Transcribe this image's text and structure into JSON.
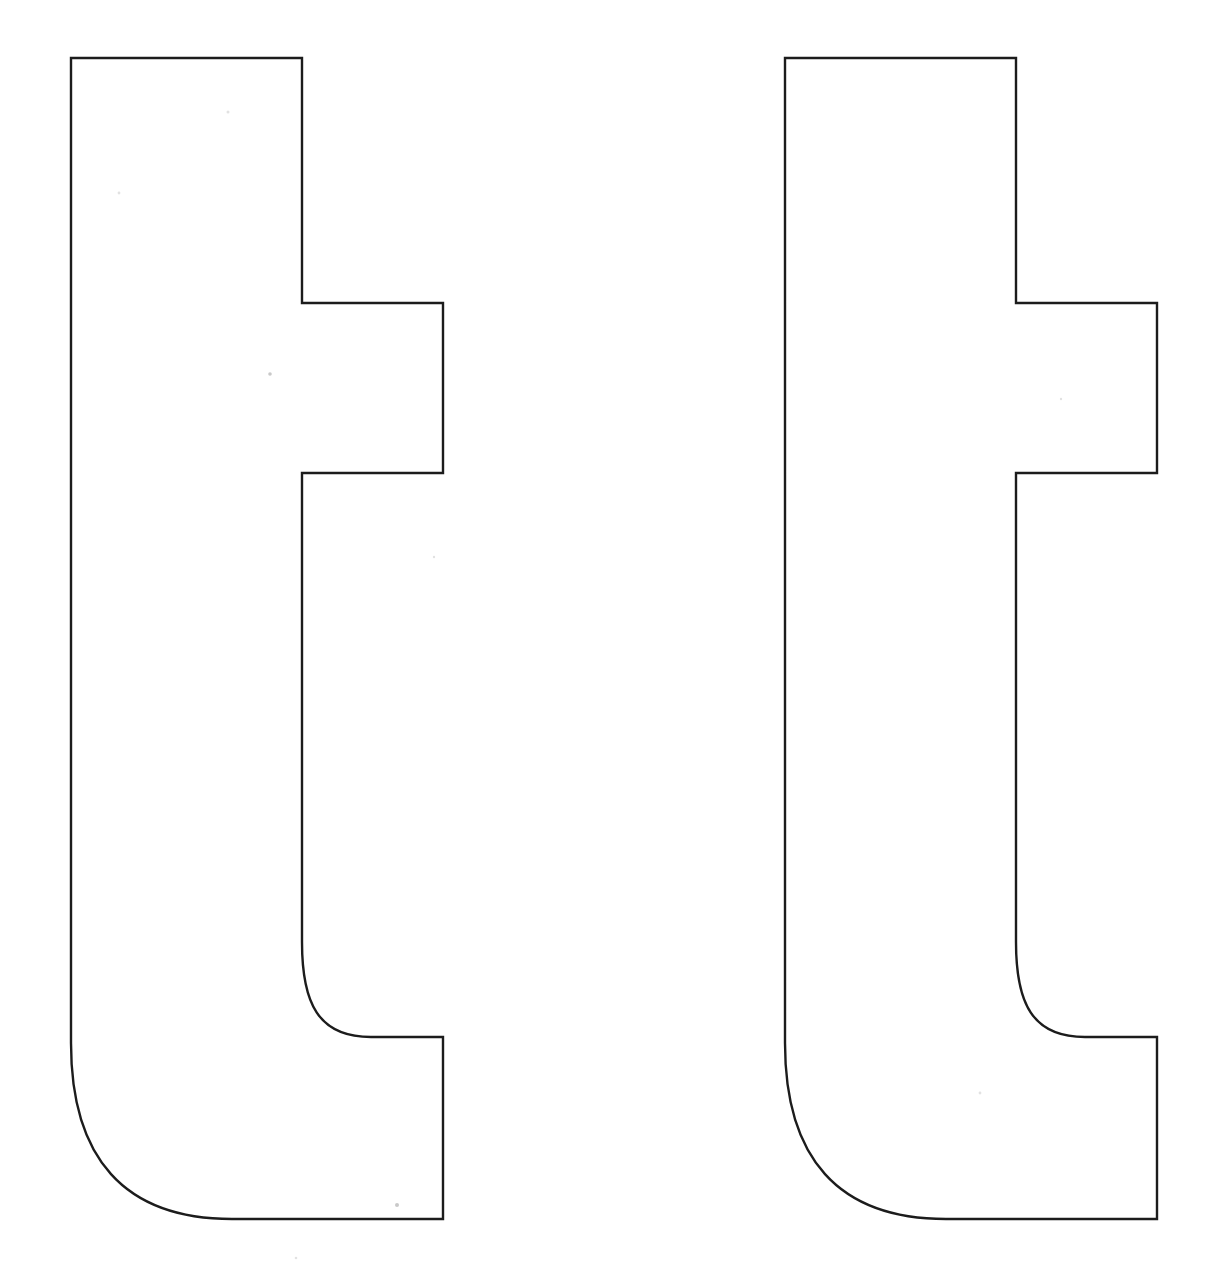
{
  "page": {
    "background_color": "#ffffff",
    "width": 1224,
    "height": 1284
  },
  "style": {
    "stroke_color": "#1c1c1c",
    "fill_color": "#ffffff",
    "stroke_width": 2.4,
    "speck_color": "#c9c9c9"
  },
  "glyphs": [
    {
      "id": "glyph-left",
      "character": "t",
      "label": "lowercase-t-outline-left",
      "offset_x": 0,
      "bounds": {
        "x": 71,
        "y": 58,
        "width": 372,
        "height": 1161
      },
      "geometry": {
        "stem_left_x": 71,
        "stem_right_x": 302,
        "top_y": 58,
        "crossbar_top_y": 303,
        "crossbar_right_x": 443,
        "crossbar_bottom_y": 473,
        "inner_curve_start_y": 985,
        "tail_top_y": 1037,
        "tail_right_x": 443,
        "bottom_y": 1219,
        "outer_curve_start_y": 1025
      },
      "path": "M 71 58 L 302 58 L 302 303 L 443 303 L 443 473 L 302 473 L 302 942 C 302 1003 318 1037 371 1037 L 443 1037 L 443 1219 L 232 1219 C 124 1219 71 1158 71 1043 Z"
    },
    {
      "id": "glyph-right",
      "character": "t",
      "label": "lowercase-t-outline-right",
      "offset_x": 714,
      "bounds": {
        "x": 785,
        "y": 58,
        "width": 372,
        "height": 1161
      },
      "geometry": {
        "stem_left_x": 785,
        "stem_right_x": 1016,
        "top_y": 58,
        "crossbar_top_y": 303,
        "crossbar_right_x": 1157,
        "crossbar_bottom_y": 473,
        "inner_curve_start_y": 985,
        "tail_top_y": 1037,
        "tail_right_x": 1157,
        "bottom_y": 1219,
        "outer_curve_start_y": 1025
      },
      "path": "M 785 58 L 1016 58 L 1016 303 L 1157 303 L 1157 473 L 1016 473 L 1016 942 C 1016 1003 1032 1037 1085 1037 L 1157 1037 L 1157 1219 L 946 1219 C 838 1219 785 1158 785 1043 Z"
    }
  ],
  "specks": [
    {
      "x": 228,
      "y": 112,
      "r": 1.5,
      "faint": true
    },
    {
      "x": 119,
      "y": 193,
      "r": 1.4,
      "faint": true
    },
    {
      "x": 270,
      "y": 374,
      "r": 1.8,
      "faint": false
    },
    {
      "x": 434,
      "y": 557,
      "r": 1.2,
      "faint": true
    },
    {
      "x": 397,
      "y": 1205,
      "r": 2.0,
      "faint": false
    },
    {
      "x": 296,
      "y": 1258,
      "r": 1.3,
      "faint": true
    },
    {
      "x": 980,
      "y": 1093,
      "r": 1.4,
      "faint": true
    },
    {
      "x": 1061,
      "y": 399,
      "r": 1.2,
      "faint": true
    }
  ]
}
